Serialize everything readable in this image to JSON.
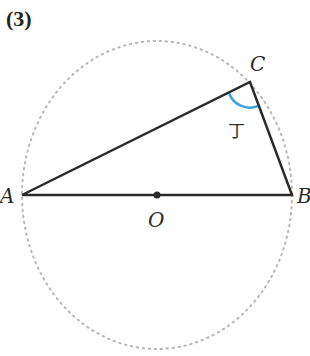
{
  "problem_number": "(3)",
  "labels": {
    "A": "A",
    "B": "B",
    "C": "C",
    "O": "O"
  },
  "angle_mark": "丁",
  "colors": {
    "line": "#2b2b2b",
    "circle": "#b8b8b8",
    "arc": "#3ba3e0"
  },
  "geometry": {
    "circle_center": [
      157,
      195
    ],
    "circle_rx": 135,
    "circle_ry": 154,
    "points": {
      "A": [
        22,
        195
      ],
      "B": [
        292,
        195
      ],
      "C": [
        250,
        82
      ],
      "O": [
        157,
        195
      ]
    }
  }
}
